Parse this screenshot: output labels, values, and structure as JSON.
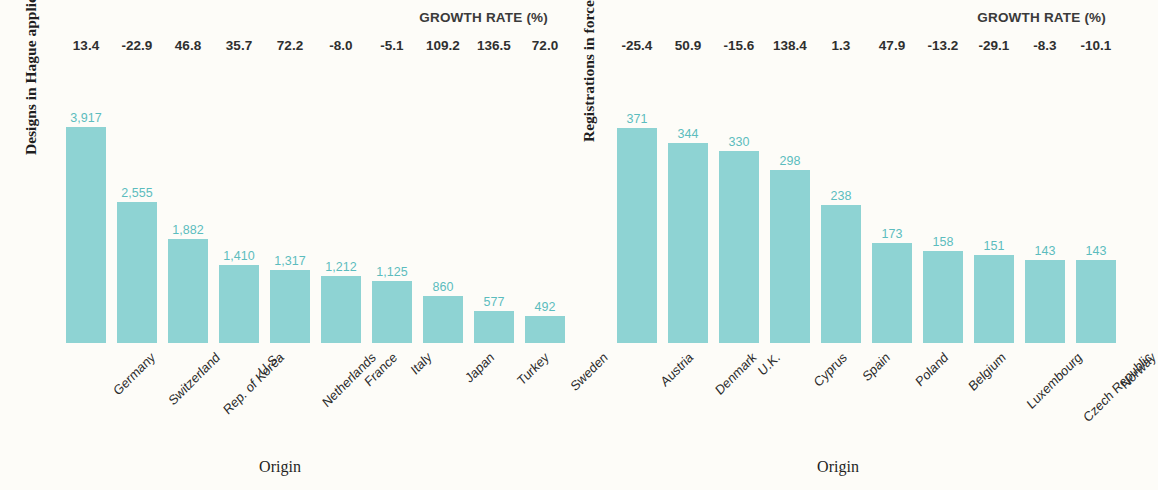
{
  "chart_data": [
    {
      "type": "bar",
      "title": "",
      "panel": "left",
      "ylabel": "Designs in Hague applications",
      "xlabel": "Origin",
      "growth_header": "GROWTH RATE (%)",
      "grid": false,
      "legend": "none",
      "ylim": [
        0,
        4300
      ],
      "categories": [
        "Germany",
        "Switzerland",
        "Rep. of Korea",
        "U.S.",
        "Netherlands",
        "France",
        "Italy",
        "Japan",
        "Turkey",
        "Sweden"
      ],
      "values": [
        3917,
        2555,
        1882,
        1410,
        1317,
        1212,
        1125,
        860,
        577,
        492
      ],
      "value_labels": [
        "3,917",
        "2,555",
        "1,882",
        "1,410",
        "1,317",
        "1,212",
        "1,125",
        "860",
        "577",
        "492"
      ],
      "growth_rates": [
        13.4,
        -22.9,
        46.8,
        35.7,
        72.2,
        -8.0,
        -5.1,
        109.2,
        136.5,
        72.0
      ],
      "growth_labels": [
        "13.4",
        "-22.9",
        "46.8",
        "35.7",
        "72.2",
        "-8.0",
        "-5.1",
        "109.2",
        "136.5",
        "72.0"
      ]
    },
    {
      "type": "bar",
      "title": "",
      "panel": "right",
      "ylabel": "Registrations in force",
      "xlabel": "Origin",
      "growth_header": "GROWTH RATE (%)",
      "grid": false,
      "legend": "none",
      "ylim": [
        0,
        408
      ],
      "categories": [
        "Austria",
        "Denmark",
        "U.K.",
        "Cyprus",
        "Spain",
        "Poland",
        "Belgium",
        "Luxembourg",
        "Czech Republic",
        "Norway"
      ],
      "values": [
        371,
        344,
        330,
        298,
        238,
        173,
        158,
        151,
        143,
        143
      ],
      "value_labels": [
        "371",
        "344",
        "330",
        "298",
        "238",
        "173",
        "158",
        "151",
        "143",
        "143"
      ],
      "growth_rates": [
        -25.4,
        50.9,
        -15.6,
        138.4,
        1.3,
        47.9,
        -13.2,
        -29.1,
        -8.3,
        -10.1
      ],
      "growth_labels": [
        "-25.4",
        "50.9",
        "-15.6",
        "138.4",
        "1.3",
        "47.9",
        "-13.2",
        "-29.1",
        "-8.3",
        "-10.1"
      ]
    }
  ],
  "colors": {
    "bar_fill": "#8ed3d3",
    "value_label": "#5cbcbe",
    "text": "#2b2b2b",
    "background": "#fdfcf8"
  }
}
